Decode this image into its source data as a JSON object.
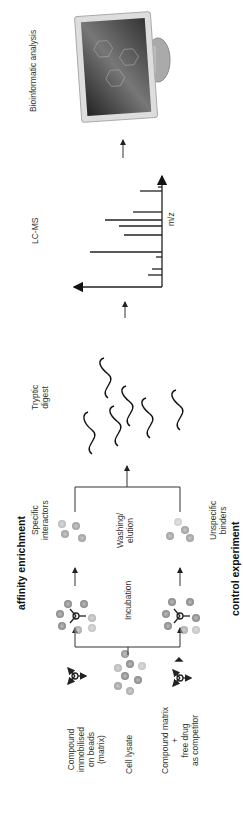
{
  "diagram": {
    "title_top": "affinity enrichment",
    "title_bottom": "control experiment",
    "inputs": {
      "compound_matrix": "Compound\nimmobilised\non beads\n(matrix)",
      "cell_lysate": "Cell lysate",
      "competition": "Compound matrix\n+\nfree drug\nas competitor"
    },
    "steps": {
      "incubation": "Incubation",
      "washing": "Washing/\nelution",
      "specific": "Specific\ninteractors",
      "unspecific": "Unspecific\nbinders",
      "tryptic": "Tryptic\ndigest",
      "lcms": "LC-MS",
      "bioinformatic": "Bioinformatic analysis"
    },
    "spectrum": {
      "xlabel": "m/z",
      "peaks": [
        {
          "pos": 12,
          "height": 14
        },
        {
          "pos": 18,
          "height": 10
        },
        {
          "pos": 30,
          "height": 6
        },
        {
          "pos": 35,
          "height": 72
        },
        {
          "pos": 52,
          "height": 38
        },
        {
          "pos": 61,
          "height": 43
        },
        {
          "pos": 67,
          "height": 57
        },
        {
          "pos": 75,
          "height": 29
        },
        {
          "pos": 96,
          "height": 22
        },
        {
          "pos": 100,
          "height": 4
        }
      ]
    },
    "peptide_labels": {
      "n_term": "H2N",
      "c_term": "COOH"
    }
  }
}
